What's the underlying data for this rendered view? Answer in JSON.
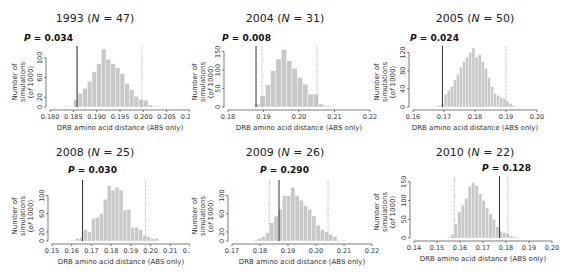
{
  "figure": {
    "ylabel_line1": "Number of simulations",
    "ylabel_line2": "(of 1000)",
    "xlabel": "DRB amino acid distance (ABS only)"
  },
  "chart_data": [
    {
      "type": "bar",
      "title": "1993 (N = 47)",
      "year": "1993",
      "N": "47",
      "p_label": "P = 0.034",
      "p_value": "0.034",
      "xlabel": "DRB amino acid distance (ABS only)",
      "ylabel": "Number of simulations (of 1000)",
      "xlim": [
        0.18,
        0.21
      ],
      "xticks": [
        "0.180",
        "0.185",
        "0.190",
        "0.195",
        "0.200",
        "0.205",
        "0.210"
      ],
      "ylim": [
        0,
        120
      ],
      "yticks": [
        "0",
        "20",
        "60",
        "100"
      ],
      "bin_width": 0.001,
      "bins_start": [
        0.183,
        0.184,
        0.185,
        0.186,
        0.187,
        0.188,
        0.189,
        0.19,
        0.191,
        0.192,
        0.193,
        0.194,
        0.195,
        0.196,
        0.197,
        0.198,
        0.199,
        0.2,
        0.201,
        0.202,
        0.203,
        0.204
      ],
      "values": [
        2,
        1,
        15,
        28,
        38,
        52,
        72,
        88,
        118,
        97,
        88,
        80,
        68,
        48,
        35,
        22,
        15,
        14,
        4,
        2,
        1,
        1
      ],
      "observed_line": 0.1858,
      "ci_lines": [
        0.1858,
        0.1997
      ]
    },
    {
      "type": "bar",
      "title": "2004 (N = 31)",
      "year": "2004",
      "N": "31",
      "p_label": "P = 0.008",
      "p_value": "0.008",
      "xlabel": "DRB amino acid distance (ABS only)",
      "ylabel": "Number of simulations (of 1000)",
      "xlim": [
        0.18,
        0.22
      ],
      "xticks": [
        "0.18",
        "0.19",
        "0.20",
        "0.21",
        "0.22"
      ],
      "ylim": [
        0,
        160
      ],
      "yticks": [
        "0",
        "50",
        "100",
        "150"
      ],
      "bin_width": 0.0015,
      "bins_start": [
        0.1875,
        0.189,
        0.1905,
        0.192,
        0.1935,
        0.195,
        0.1965,
        0.198,
        0.1995,
        0.201,
        0.2025,
        0.204,
        0.2055,
        0.207,
        0.2085
      ],
      "values": [
        8,
        30,
        60,
        98,
        130,
        155,
        125,
        105,
        80,
        62,
        35,
        35,
        8,
        3,
        2
      ],
      "observed_line": 0.1879,
      "ci_lines": [
        0.1896,
        0.2051
      ]
    },
    {
      "type": "bar",
      "title": "2005 (N = 50)",
      "year": "2005",
      "N": "50",
      "p_label": "P = 0.024",
      "p_value": "0.024",
      "xlabel": "DRB amino acid distance (ABS only)",
      "ylabel": "Number of simulations (of 1000)",
      "xlim": [
        0.16,
        0.2
      ],
      "xticks": [
        "0.16",
        "0.17",
        "0.18",
        "0.19",
        "0.20"
      ],
      "ylim": [
        0,
        130
      ],
      "yticks": [
        "0",
        "40",
        "80",
        "120"
      ],
      "bin_width": 0.001,
      "bins_start": [
        0.167,
        0.168,
        0.169,
        0.17,
        0.171,
        0.172,
        0.173,
        0.174,
        0.175,
        0.176,
        0.177,
        0.178,
        0.179,
        0.18,
        0.181,
        0.182,
        0.183,
        0.184,
        0.185,
        0.186,
        0.187,
        0.188,
        0.189,
        0.19,
        0.191,
        0.192,
        0.193,
        0.194
      ],
      "values": [
        2,
        4,
        8,
        28,
        36,
        45,
        60,
        72,
        88,
        100,
        110,
        120,
        130,
        110,
        115,
        100,
        85,
        65,
        45,
        30,
        26,
        20,
        18,
        12,
        8,
        4,
        2,
        1
      ],
      "observed_line": 0.1695,
      "ci_lines": [
        0.1695,
        0.19
      ]
    },
    {
      "type": "bar",
      "title": "2008 (N = 25)",
      "year": "2008",
      "N": "25",
      "p_label": "P = 0.030",
      "p_value": "0.030",
      "xlabel": "DRB amino acid distance (ABS only)",
      "ylabel": "Number of simulations (of 1000)",
      "xlim": [
        0.15,
        0.22
      ],
      "xticks": [
        "0.15",
        "0.16",
        "0.17",
        "0.18",
        "0.19",
        "0.20",
        "0.21",
        "0.22"
      ],
      "ylim": [
        0,
        130
      ],
      "yticks": [
        "0",
        "20",
        "60",
        "100"
      ],
      "bin_width": 0.002,
      "bins_start": [
        0.158,
        0.16,
        0.162,
        0.164,
        0.166,
        0.168,
        0.17,
        0.172,
        0.174,
        0.176,
        0.178,
        0.18,
        0.182,
        0.184,
        0.186,
        0.188,
        0.19,
        0.192,
        0.194,
        0.196,
        0.198,
        0.2,
        0.202,
        0.204,
        0.206
      ],
      "values": [
        1,
        2,
        6,
        8,
        25,
        20,
        50,
        52,
        60,
        92,
        122,
        112,
        118,
        112,
        68,
        70,
        30,
        30,
        25,
        12,
        10,
        5,
        6,
        1,
        1
      ],
      "observed_line": 0.1655,
      "ci_lines": [
        0.1655,
        0.1975
      ]
    },
    {
      "type": "bar",
      "title": "2009 (N = 26)",
      "year": "2009",
      "N": "26",
      "p_label": "P = 0.290",
      "p_value": "0.290",
      "xlabel": "DRB amino acid distance (ABS only)",
      "ylabel": "Number of simulations (of 1000)",
      "xlim": [
        0.17,
        0.22
      ],
      "xticks": [
        "0.17",
        "0.18",
        "0.19",
        "0.20",
        "0.21",
        "0.22"
      ],
      "ylim": [
        0,
        130
      ],
      "yticks": [
        "0",
        "20",
        "60",
        "100"
      ],
      "bin_width": 0.0015,
      "bins_start": [
        0.1775,
        0.179,
        0.1805,
        0.182,
        0.1835,
        0.185,
        0.1865,
        0.188,
        0.1895,
        0.191,
        0.1925,
        0.194,
        0.1955,
        0.197,
        0.1985,
        0.2,
        0.2015,
        0.203,
        0.2045,
        0.206,
        0.2075,
        0.209
      ],
      "values": [
        2,
        5,
        10,
        18,
        40,
        55,
        70,
        100,
        100,
        118,
        100,
        90,
        78,
        70,
        55,
        35,
        25,
        20,
        15,
        10,
        1,
        2
      ],
      "observed_line": 0.1868,
      "ci_lines": [
        0.1833,
        0.2043
      ]
    },
    {
      "type": "bar",
      "title": "2010 (N = 22)",
      "year": "2010",
      "N": "22",
      "p_label": "P = 0.128",
      "p_value": "0.128",
      "xlabel": "DRB amino acid distance (ABS only)",
      "ylabel": "Number of simulations (of 1000)",
      "xlim": [
        0.14,
        0.2
      ],
      "xticks": [
        "0.14",
        "0.15",
        "0.16",
        "0.17",
        "0.18",
        "0.19",
        "0.20"
      ],
      "ylim": [
        0,
        160
      ],
      "yticks": [
        "0",
        "50",
        "100",
        "150"
      ],
      "bin_width": 0.0015,
      "bins_start": [
        0.1545,
        0.156,
        0.1575,
        0.159,
        0.1605,
        0.162,
        0.1635,
        0.165,
        0.1665,
        0.168,
        0.1695,
        0.171,
        0.1725,
        0.174,
        0.1755,
        0.177,
        0.1785,
        0.18,
        0.1815,
        0.183,
        0.1845
      ],
      "values": [
        3,
        10,
        38,
        70,
        88,
        105,
        138,
        148,
        140,
        118,
        100,
        80,
        65,
        50,
        30,
        18,
        15,
        12,
        6,
        4,
        2
      ],
      "observed_line": 0.1772,
      "ci_lines": [
        0.1575,
        0.1808
      ]
    }
  ]
}
